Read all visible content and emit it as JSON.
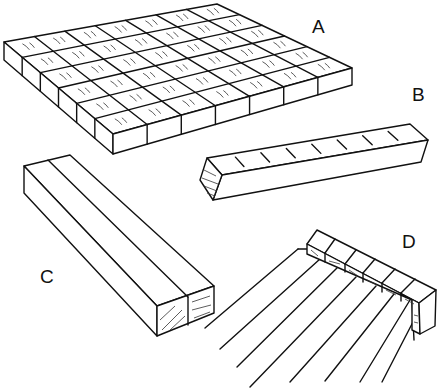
{
  "figure": {
    "panels": [
      {
        "id": "A",
        "label": "A",
        "description": "grid-of-end-grain-blocks",
        "rows": 6,
        "cols": 7
      },
      {
        "id": "B",
        "label": "B",
        "description": "single-long-square-stick"
      },
      {
        "id": "C",
        "label": "C",
        "description": "two-sticks-glued-side-by-side"
      },
      {
        "id": "D",
        "label": "D",
        "description": "row-of-blocks-on-strip-with-lines"
      }
    ],
    "colors": {
      "ink": "#111111",
      "background": "#ffffff"
    }
  }
}
